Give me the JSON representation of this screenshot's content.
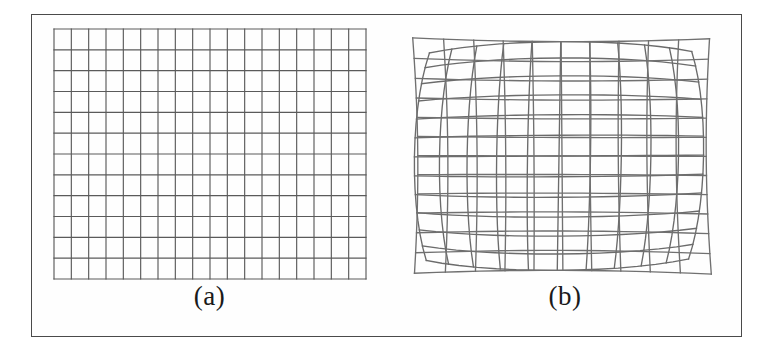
{
  "figure": {
    "caption_a": "(a)",
    "caption_b": "(b)",
    "frame_color": "#4a4a4a",
    "background_color": "#ffffff",
    "line_color": "#5a5a5a",
    "distorted_line_color": "#6b6b6b"
  },
  "chart_data": {
    "type": "diagram",
    "title": "",
    "subtitle": "",
    "panels": [
      {
        "id": "a",
        "label": "(a)",
        "description": "Regular undistorted rectangular calibration grid",
        "grid": {
          "columns": 18,
          "rows": 12,
          "x0": 22,
          "y0": 14,
          "x1": 334,
          "y1": 264,
          "distortion_k": 0.0,
          "tilt": 0.0,
          "line_color": "#5a5a5a",
          "line_width": 1.15
        },
        "overlay_grid": null
      },
      {
        "id": "b",
        "label": "(b)",
        "description": "Distorted (barrel/pincushion warped) grid overlaid with the recovered regular grid",
        "grid": {
          "columns": 10,
          "rows": 12,
          "x0": 14,
          "y0": 16,
          "x1": 330,
          "y1": 266,
          "distortion_k": -0.085,
          "tilt": -0.012,
          "line_color": "#6b6b6b",
          "line_width": 1.35
        },
        "overlay_grid": {
          "columns": 10,
          "rows": 12,
          "x0": 35,
          "y0": 30,
          "x1": 315,
          "y1": 252,
          "distortion_k": 0.03,
          "tilt": 0.006,
          "line_color": "#707070",
          "line_width": 1.35
        }
      }
    ],
    "xlabel": "",
    "ylabel": "",
    "legend": [],
    "grid_on": true
  }
}
